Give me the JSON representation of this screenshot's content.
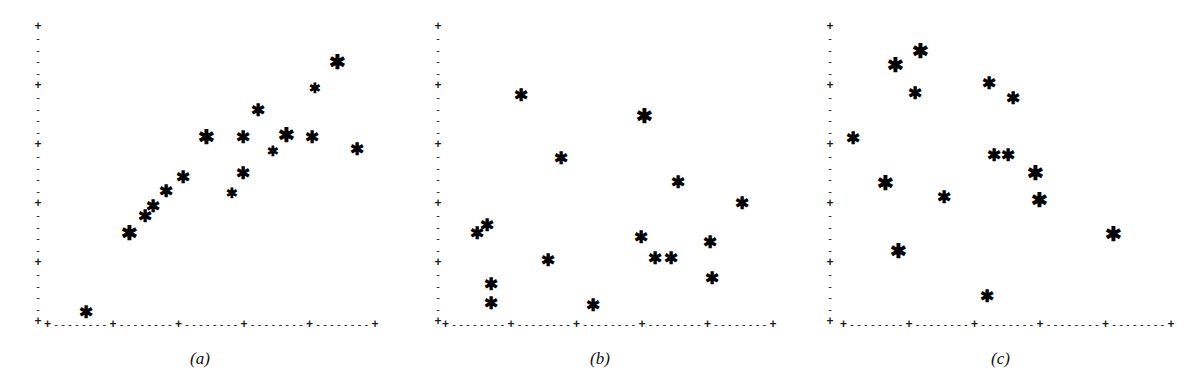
{
  "figure": {
    "width": 1201,
    "height": 373,
    "background": "#ffffff",
    "marker_glyph": "✱",
    "marker_color": "#000000",
    "axis_color": "#1a1a1a",
    "axis_major_glyph": "+",
    "axis_minor_glyph": "-",
    "axis_style": "dashed-plus-tick"
  },
  "chart_data": [
    {
      "type": "scatter",
      "title": "(a)",
      "caption": "(a)",
      "xlabel": "",
      "ylabel": "",
      "xlim": [
        0,
        100
      ],
      "ylim": [
        0,
        100
      ],
      "grid": false,
      "legend": "none",
      "pattern": "strong positive correlation",
      "x_major_ticks": 6,
      "y_major_ticks": 6,
      "y_minor_per_major": 5,
      "marker": "asterisk",
      "n_points": 17,
      "points": [
        {
          "x": 12.5,
          "y": 4.0,
          "size": "m"
        },
        {
          "x": 25.5,
          "y": 30.5,
          "size": "l"
        },
        {
          "x": 30.0,
          "y": 36.0,
          "size": "m"
        },
        {
          "x": 32.5,
          "y": 39.5,
          "size": "m"
        },
        {
          "x": 36.5,
          "y": 44.5,
          "size": "m"
        },
        {
          "x": 41.5,
          "y": 49.0,
          "size": "m"
        },
        {
          "x": 48.5,
          "y": 62.5,
          "size": "l"
        },
        {
          "x": 56.0,
          "y": 43.5,
          "size": "s"
        },
        {
          "x": 59.5,
          "y": 50.5,
          "size": "m"
        },
        {
          "x": 59.5,
          "y": 62.5,
          "size": "m"
        },
        {
          "x": 64.0,
          "y": 71.5,
          "size": "m"
        },
        {
          "x": 68.5,
          "y": 57.5,
          "size": "s"
        },
        {
          "x": 72.5,
          "y": 63.0,
          "size": "l"
        },
        {
          "x": 80.0,
          "y": 62.5,
          "size": "m"
        },
        {
          "x": 81.0,
          "y": 78.5,
          "size": "s"
        },
        {
          "x": 87.5,
          "y": 87.5,
          "size": "l"
        },
        {
          "x": 93.5,
          "y": 58.5,
          "size": "m"
        }
      ]
    },
    {
      "type": "scatter",
      "title": "(b)",
      "caption": "(b)",
      "xlabel": "",
      "ylabel": "",
      "xlim": [
        0,
        100
      ],
      "ylim": [
        0,
        100
      ],
      "grid": false,
      "legend": "none",
      "pattern": "no correlation / random scatter",
      "x_major_ticks": 6,
      "y_major_ticks": 6,
      "y_minor_per_major": 5,
      "marker": "asterisk",
      "n_points": 16,
      "points": [
        {
          "x": 14.5,
          "y": 7.0,
          "size": "m"
        },
        {
          "x": 14.5,
          "y": 13.5,
          "size": "m"
        },
        {
          "x": 23.5,
          "y": 76.5,
          "size": "m"
        },
        {
          "x": 10.5,
          "y": 30.5,
          "size": "m"
        },
        {
          "x": 13.5,
          "y": 33.0,
          "size": "m"
        },
        {
          "x": 31.5,
          "y": 21.5,
          "size": "m"
        },
        {
          "x": 35.5,
          "y": 55.5,
          "size": "m"
        },
        {
          "x": 45.0,
          "y": 6.5,
          "size": "m"
        },
        {
          "x": 59.5,
          "y": 29.0,
          "size": "m"
        },
        {
          "x": 60.5,
          "y": 69.5,
          "size": "l"
        },
        {
          "x": 63.5,
          "y": 22.0,
          "size": "m"
        },
        {
          "x": 68.5,
          "y": 22.0,
          "size": "m"
        },
        {
          "x": 70.5,
          "y": 47.5,
          "size": "m"
        },
        {
          "x": 80.0,
          "y": 27.5,
          "size": "m"
        },
        {
          "x": 80.5,
          "y": 15.5,
          "size": "m"
        },
        {
          "x": 89.5,
          "y": 40.5,
          "size": "m"
        }
      ]
    },
    {
      "type": "scatter",
      "title": "(c)",
      "caption": "(c)",
      "xlabel": "",
      "ylabel": "",
      "xlim": [
        0,
        100
      ],
      "ylim": [
        0,
        100
      ],
      "grid": false,
      "legend": "none",
      "pattern": "weak / diffuse negative scatter",
      "x_major_ticks": 6,
      "y_major_ticks": 6,
      "y_minor_per_major": 5,
      "marker": "asterisk",
      "n_points": 15,
      "points": [
        {
          "x": 4.0,
          "y": 62.0,
          "size": "m"
        },
        {
          "x": 16.5,
          "y": 86.5,
          "size": "l"
        },
        {
          "x": 24.0,
          "y": 91.0,
          "size": "l"
        },
        {
          "x": 22.5,
          "y": 77.0,
          "size": "m"
        },
        {
          "x": 13.5,
          "y": 47.0,
          "size": "l"
        },
        {
          "x": 17.5,
          "y": 24.5,
          "size": "l"
        },
        {
          "x": 31.0,
          "y": 42.5,
          "size": "m"
        },
        {
          "x": 44.5,
          "y": 80.5,
          "size": "m"
        },
        {
          "x": 46.0,
          "y": 56.5,
          "size": "m"
        },
        {
          "x": 50.0,
          "y": 56.5,
          "size": "m"
        },
        {
          "x": 51.5,
          "y": 75.5,
          "size": "m"
        },
        {
          "x": 44.0,
          "y": 9.5,
          "size": "m"
        },
        {
          "x": 58.5,
          "y": 50.5,
          "size": "l"
        },
        {
          "x": 59.5,
          "y": 41.5,
          "size": "l"
        },
        {
          "x": 81.5,
          "y": 30.0,
          "size": "l"
        }
      ]
    }
  ],
  "panels": [
    {
      "id": "a",
      "caption": "(a)",
      "left": 0,
      "width": 400,
      "axis": {
        "y_left": 30,
        "y_top": 24,
        "y_bottom": 324,
        "x_left": 44,
        "x_right": 379,
        "x_baseline": 324
      }
    },
    {
      "id": "b",
      "caption": "(b)",
      "left": 400,
      "width": 400,
      "axis": {
        "y_left": 30,
        "y_top": 24,
        "y_bottom": 324,
        "x_left": 42,
        "x_right": 377,
        "x_baseline": 324
      }
    },
    {
      "id": "c",
      "caption": "(c)",
      "left": 800,
      "width": 401,
      "axis": {
        "y_left": 22,
        "y_top": 24,
        "y_bottom": 324,
        "x_left": 40,
        "x_right": 375,
        "x_baseline": 324
      }
    }
  ]
}
